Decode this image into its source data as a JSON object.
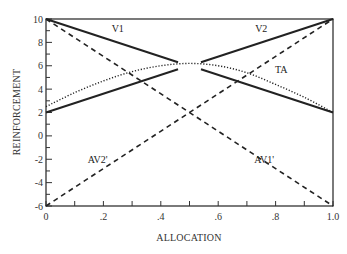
{
  "chart_data": {
    "type": "line",
    "title": "",
    "xlabel": "ALLOCATION",
    "ylabel": "REINFORCEMENT",
    "xlim": [
      0,
      1.0
    ],
    "ylim": [
      -6,
      10
    ],
    "x_ticks": [
      0,
      0.1,
      0.2,
      0.3,
      0.4,
      0.5,
      0.6,
      0.7,
      0.8,
      0.9,
      1.0
    ],
    "x_tick_labels": [
      "0",
      ".2",
      ".4",
      ".6",
      ".8",
      "1.0"
    ],
    "x_tick_label_values": [
      0,
      0.2,
      0.4,
      0.6,
      0.8,
      1.0
    ],
    "y_ticks": [
      -6,
      -5,
      -4,
      -3,
      -2,
      -1,
      0,
      1,
      2,
      3,
      4,
      5,
      6,
      7,
      8,
      9,
      10
    ],
    "y_tick_labels": [
      "-6",
      "-4",
      "-2",
      "0",
      "2",
      "4",
      "6",
      "8",
      "10"
    ],
    "y_tick_label_values": [
      -6,
      -4,
      -2,
      0,
      2,
      4,
      6,
      8,
      10
    ],
    "grid": false,
    "legend": "inline labels",
    "series": [
      {
        "name": "V1",
        "style": "solid",
        "label_pos": [
          0.25,
          8.9
        ],
        "segments": [
          [
            [
              0,
              10
            ],
            [
              0.46,
              6.3
            ]
          ],
          [
            [
              0.54,
              5.7
            ],
            [
              1.0,
              2
            ]
          ]
        ]
      },
      {
        "name": "V2",
        "style": "solid",
        "label_pos": [
          0.75,
          8.9
        ],
        "segments": [
          [
            [
              0,
              2
            ],
            [
              0.46,
              5.7
            ]
          ],
          [
            [
              0.54,
              6.3
            ],
            [
              1.0,
              10
            ]
          ]
        ]
      },
      {
        "name": "TA",
        "style": "dotted",
        "label_pos": [
          0.82,
          5.4
        ],
        "x": [
          0,
          0.1,
          0.2,
          0.3,
          0.4,
          0.5,
          0.6,
          0.7,
          0.8,
          0.9,
          1.0
        ],
        "values": [
          2.5,
          3.7,
          4.7,
          5.5,
          6.0,
          6.2,
          6.0,
          5.4,
          4.4,
          3.3,
          2.0
        ]
      },
      {
        "name": "AV1'",
        "style": "dashed",
        "label_pos": [
          0.76,
          -2.3
        ],
        "x": [
          0,
          1.0
        ],
        "values": [
          10,
          -6
        ]
      },
      {
        "name": "AV2'",
        "style": "dashed",
        "label_pos": [
          0.18,
          -2.3
        ],
        "x": [
          0,
          1.0
        ],
        "values": [
          -6,
          10
        ]
      }
    ]
  }
}
